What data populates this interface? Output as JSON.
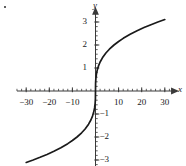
{
  "figure": {
    "background_color": "#ffffff",
    "curve_color": "#1a1a1a",
    "axis_color": "#3a3a3a",
    "text_color": "#1a1a1a",
    "corner_mark": "•"
  },
  "chart_data": {
    "type": "line",
    "title": "",
    "subtitle": "",
    "function": "y = cube root of x",
    "xlabel": "x",
    "ylabel": "y",
    "xlim": [
      -34,
      34
    ],
    "ylim": [
      -3.4,
      3.4
    ],
    "grid": false,
    "legend": null,
    "x_major_ticks": [
      -30,
      -20,
      -10,
      10,
      20,
      30
    ],
    "x_major_tick_labels": [
      "−30",
      "−20",
      "−10",
      "10",
      "20",
      "30"
    ],
    "x_minor_tick_step": 2,
    "y_major_ticks": [
      3,
      2,
      1,
      -1,
      -2,
      -3
    ],
    "y_major_tick_labels": [
      "3",
      "2",
      "1",
      "−1",
      "−2",
      "−3"
    ],
    "y_minor_tick_step": 0.2,
    "x_axis_arrow": true,
    "y_axis_arrow": true,
    "series": [
      {
        "name": "y = x^(1/3)",
        "x": [
          -30,
          -27,
          -24,
          -21,
          -18,
          -15,
          -12,
          -10,
          -8,
          -6,
          -4.5,
          -3,
          -2,
          -1.3,
          -0.8,
          -0.4,
          -0.15,
          -0.04,
          0,
          0.04,
          0.15,
          0.4,
          0.8,
          1.3,
          2,
          3,
          4.5,
          6,
          8,
          10,
          12,
          15,
          18,
          21,
          24,
          27,
          30
        ],
        "y": [
          -3.107,
          -3.0,
          -2.884,
          -2.759,
          -2.621,
          -2.466,
          -2.289,
          -2.154,
          -2.0,
          -1.817,
          -1.651,
          -1.442,
          -1.26,
          -1.091,
          -0.928,
          -0.737,
          -0.532,
          -0.342,
          0,
          0.342,
          0.532,
          0.737,
          0.928,
          1.091,
          1.26,
          1.442,
          1.651,
          1.817,
          2.0,
          2.154,
          2.289,
          2.466,
          2.621,
          2.759,
          2.884,
          3.0,
          3.107
        ]
      }
    ]
  }
}
